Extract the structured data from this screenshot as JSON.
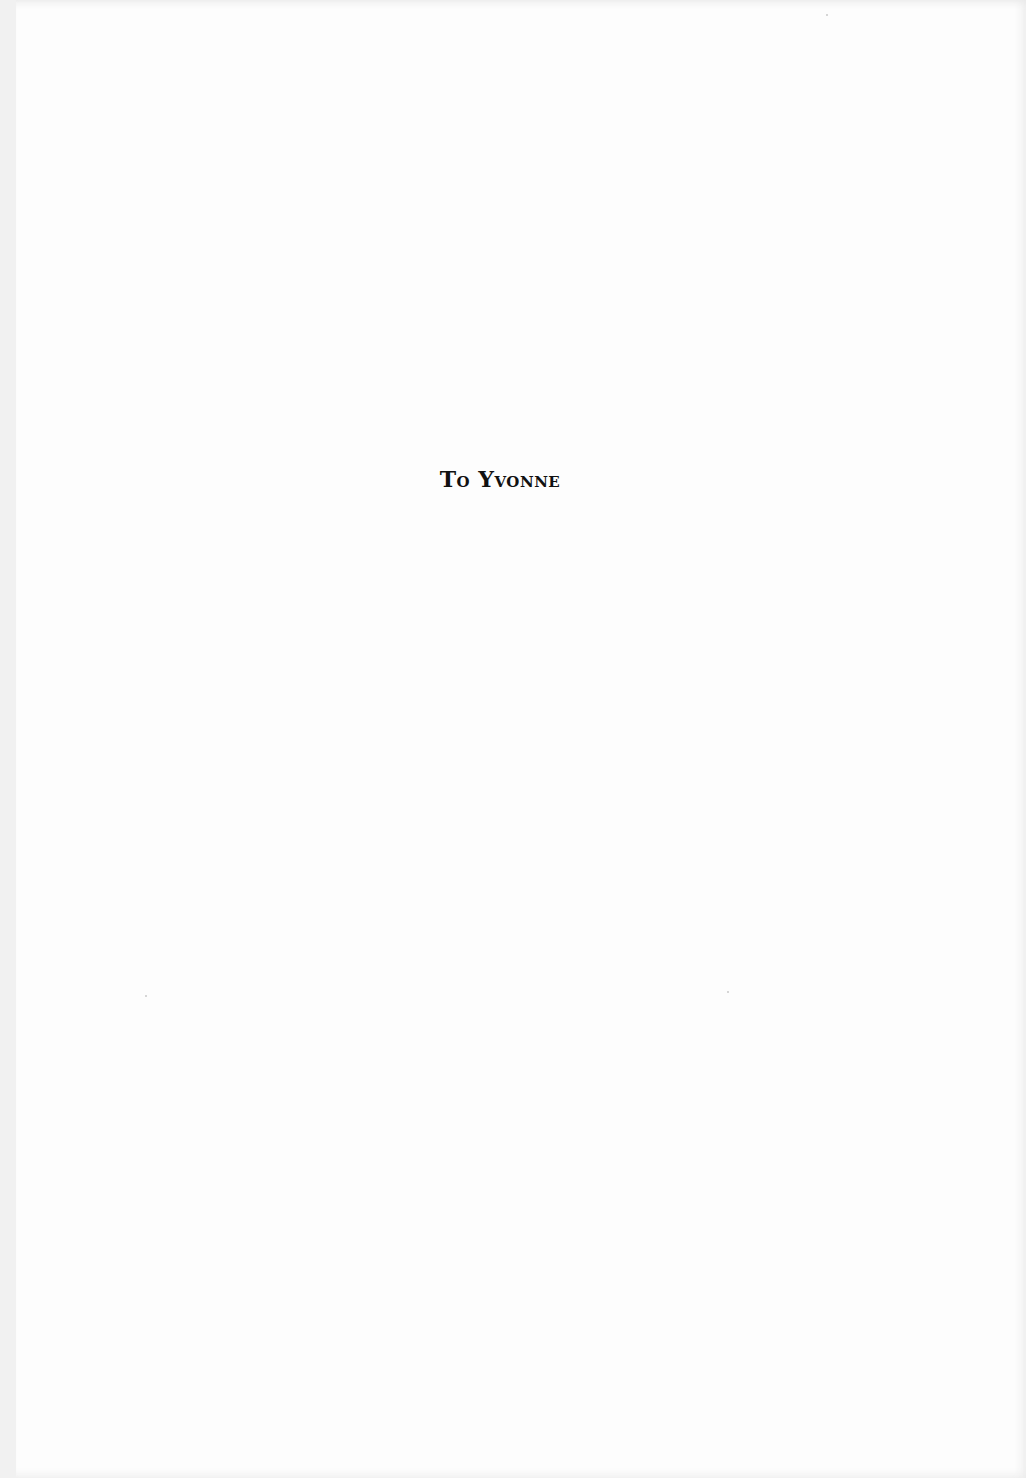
{
  "page": {
    "type": "dedication-page",
    "dedication": "To Yvonne",
    "background_color": "#fdfdfd",
    "text_color": "#111111"
  }
}
